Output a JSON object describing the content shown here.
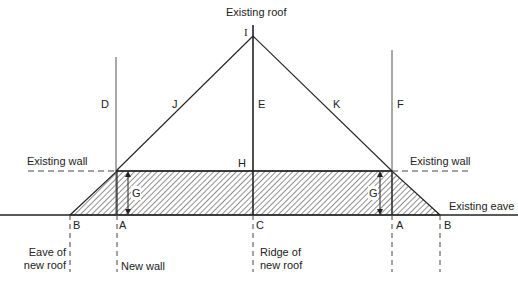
{
  "diagram": {
    "title_top": "Existing roof",
    "labels": {
      "I": "I",
      "D": "D",
      "J": "J",
      "E": "E",
      "K": "K",
      "F": "F",
      "H": "H",
      "G_left": "G",
      "G_right": "G",
      "A_left": "A",
      "A_right": "A",
      "B_left": "B",
      "B_right": "B",
      "C": "C"
    },
    "annotations": {
      "existing_wall_left": "Existing wall",
      "existing_wall_right": "Existing wall",
      "existing_eave": "Existing eave",
      "eave_of_new_roof": "Eave of\nnew roof",
      "new_wall": "New wall",
      "ridge_of_new_roof": "Ridge of\nnew roof"
    },
    "colors": {
      "line": "#222222",
      "thin_line": "#555555",
      "background": "#ffffff"
    }
  }
}
